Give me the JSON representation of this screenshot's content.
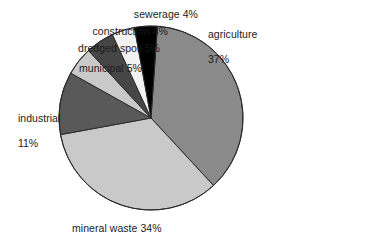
{
  "chart_data": {
    "type": "pie",
    "title": "",
    "subtitle": "",
    "xlabel": "",
    "ylabel": "",
    "legend_position": "none",
    "grid": false,
    "units": "percent",
    "total": 100,
    "start_angle_deg": 4,
    "direction": "clockwise",
    "categories": [
      "agriculture",
      "mineral waste",
      "industrial",
      "municipal",
      "dredged spoil",
      "construction",
      "sewerage"
    ],
    "values": [
      37,
      34,
      11,
      5,
      5,
      4,
      4
    ],
    "slices": [
      {
        "label": "agriculture",
        "value": 37,
        "value_text": "37%",
        "color": "#8a8a8a"
      },
      {
        "label": "mineral waste",
        "value": 34,
        "value_text": "34%",
        "color": "#c9c9c9"
      },
      {
        "label": "industrial",
        "value": 11,
        "value_text": "11%",
        "color": "#595959"
      },
      {
        "label": "municipal",
        "value": 5,
        "value_text": "5%",
        "color": "#c9c9c9"
      },
      {
        "label": "dredged spoil",
        "value": 5,
        "value_text": "5%",
        "color": "#464646"
      },
      {
        "label": "construction",
        "value": 4,
        "value_text": "4%",
        "color": "#f2f2f2"
      },
      {
        "label": "sewerage",
        "value": 4,
        "value_text": "4%",
        "color": "#000000"
      }
    ]
  },
  "labels": {
    "sewerage": "sewerage 4%",
    "construction": "construction 4%",
    "dredged_spoil": "dredged spoil 5%",
    "municipal": "municipal 5%",
    "industrial_line1": "industrial",
    "industrial_line2": "11%",
    "agriculture_line1": "agriculture",
    "agriculture_line2": "37%",
    "mineral_waste": "mineral waste 34%"
  },
  "style": {
    "background": "#ffffff",
    "text_color": "#1a1a1a",
    "outline_color": "#2b2b2b"
  }
}
